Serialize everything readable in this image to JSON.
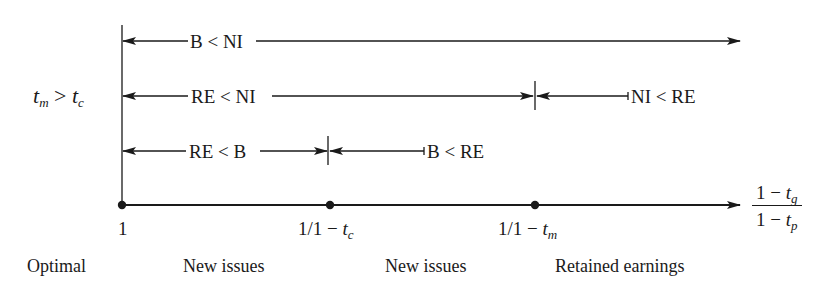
{
  "diagram": {
    "condition_label": {
      "var1": "t",
      "sub1": "m",
      "op": " > ",
      "var2": "t",
      "sub2": "c"
    },
    "rows": [
      {
        "label": "B < NI",
        "span": "1 → ∞"
      },
      {
        "left_label": "RE < NI",
        "right_label": "NI < RE",
        "split_at": "1/1 − t_m"
      },
      {
        "left_label": "RE < B",
        "right_label": "B < RE",
        "split_at": "1/1 − t_c"
      }
    ],
    "axis": {
      "ticks": [
        {
          "label": "1"
        },
        {
          "prefix": "1/1 − ",
          "var": "t",
          "sub": "c"
        },
        {
          "prefix": "1/1 − ",
          "var": "t",
          "sub": "m"
        }
      ],
      "axis_label": {
        "numerator": {
          "prefix": "1 − ",
          "var": "t",
          "sub": "g"
        },
        "denominator": {
          "prefix": "1 − ",
          "var": "t",
          "sub": "p"
        }
      }
    },
    "regions": [
      "Optimal",
      "New issues",
      "New issues",
      "Retained earnings"
    ],
    "colors": {
      "ink": "#1a1a1a",
      "background": "#ffffff"
    }
  }
}
